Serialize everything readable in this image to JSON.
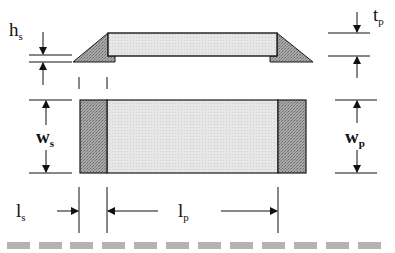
{
  "diagram": {
    "labels": {
      "hs": {
        "main": "h",
        "sub": "s"
      },
      "tp": {
        "main": "t",
        "sub": "p"
      },
      "ws": {
        "main": "w",
        "sub": "s"
      },
      "wp": {
        "main": "w",
        "sub": "p"
      },
      "ls": {
        "main": "l",
        "sub": "s"
      },
      "lp": {
        "main": "l",
        "sub": "p"
      }
    },
    "colors": {
      "pad_fill": "#e2e2e2",
      "solder_fill": "#9a9a9a",
      "outline": "#1a1a1a",
      "dash": "#b3b3b3"
    },
    "views": [
      "side-profile",
      "top-view"
    ],
    "dash_count": 12
  }
}
